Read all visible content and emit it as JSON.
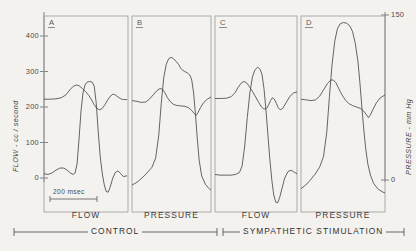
{
  "figure": {
    "axes": {
      "left": {
        "label": "FLOW - cc / second",
        "ticks": [
          {
            "value": 400,
            "text": "400"
          },
          {
            "value": 300,
            "text": "300"
          },
          {
            "value": 200,
            "text": "200"
          },
          {
            "value": 100,
            "text": "100"
          },
          {
            "value": 0,
            "text": "0"
          }
        ]
      },
      "right": {
        "label": "PRESSURE - mm Hg",
        "ticks": [
          {
            "value": 150,
            "text": "150"
          },
          {
            "value": 0,
            "text": "0"
          }
        ]
      }
    },
    "scalebar": {
      "text": "200 msec"
    },
    "panels": [
      {
        "letter": "A",
        "caption": "FLOW"
      },
      {
        "letter": "B",
        "caption": "PRESSURE"
      },
      {
        "letter": "C",
        "caption": "FLOW"
      },
      {
        "letter": "D",
        "caption": "PRESSURE"
      }
    ],
    "groups": [
      {
        "label": "CONTROL"
      },
      {
        "label": "SYMPATHETIC  STIMULATION"
      }
    ]
  },
  "chart_data": {
    "type": "line",
    "title": "",
    "xlabel": "",
    "ylabel": "FLOW - cc / second",
    "ylabel_right": "PRESSURE - mm Hg",
    "ylim": [
      0,
      450
    ],
    "ylim_right": [
      0,
      190
    ],
    "yticks": [
      0,
      100,
      200,
      300,
      400
    ],
    "yticks_right": [
      0,
      150
    ],
    "grid": false,
    "legend": "none",
    "scalebar_ms": 200,
    "panels": [
      {
        "letter": "A",
        "caption": "FLOW",
        "condition": "CONTROL",
        "series": [
          {
            "name": "baseline-trace",
            "points": [
              [
                0,
                222
              ],
              [
                10,
                222
              ],
              [
                18,
                223
              ],
              [
                26,
                226
              ],
              [
                33,
                234
              ],
              [
                39,
                248
              ],
              [
                44,
                258
              ],
              [
                49,
                262
              ],
              [
                53,
                260
              ],
              [
                58,
                252
              ],
              [
                63,
                243
              ],
              [
                68,
                232
              ],
              [
                72,
                220
              ],
              [
                76,
                206
              ],
              [
                80,
                196
              ],
              [
                84,
                192
              ],
              [
                88,
                196
              ],
              [
                92,
                206
              ],
              [
                96,
                219
              ],
              [
                100,
                230
              ],
              [
                104,
                236
              ],
              [
                108,
                234
              ],
              [
                112,
                228
              ],
              [
                116,
                223
              ],
              [
                120,
                221
              ],
              [
                125,
                221
              ]
            ]
          },
          {
            "name": "flow-trace",
            "points": [
              [
                0,
                12
              ],
              [
                6,
                10
              ],
              [
                12,
                14
              ],
              [
                18,
                22
              ],
              [
                24,
                28
              ],
              [
                30,
                28
              ],
              [
                35,
                22
              ],
              [
                40,
                14
              ],
              [
                44,
                10
              ],
              [
                47,
                14
              ],
              [
                50,
                40
              ],
              [
                53,
                110
              ],
              [
                56,
                190
              ],
              [
                59,
                240
              ],
              [
                62,
                262
              ],
              [
                65,
                270
              ],
              [
                69,
                272
              ],
              [
                73,
                270
              ],
              [
                76,
                258
              ],
              [
                79,
                210
              ],
              [
                82,
                130
              ],
              [
                85,
                60
              ],
              [
                88,
                14
              ],
              [
                91,
                -18
              ],
              [
                94,
                -38
              ],
              [
                97,
                -40
              ],
              [
                100,
                -26
              ],
              [
                104,
                0
              ],
              [
                108,
                16
              ],
              [
                112,
                20
              ],
              [
                116,
                12
              ],
              [
                120,
                4
              ],
              [
                125,
                6
              ]
            ]
          }
        ]
      },
      {
        "letter": "B",
        "caption": "PRESSURE",
        "condition": "CONTROL",
        "series": [
          {
            "name": "baseline-trace",
            "points": [
              [
                0,
                218
              ],
              [
                8,
                216
              ],
              [
                15,
                213
              ],
              [
                22,
                214
              ],
              [
                28,
                222
              ],
              [
                34,
                234
              ],
              [
                40,
                246
              ],
              [
                45,
                252
              ],
              [
                49,
                250
              ],
              [
                53,
                240
              ],
              [
                57,
                226
              ],
              [
                62,
                214
              ],
              [
                67,
                207
              ],
              [
                73,
                204
              ],
              [
                79,
                203
              ],
              [
                85,
                202
              ],
              [
                91,
                198
              ],
              [
                96,
                190
              ],
              [
                100,
                182
              ],
              [
                103,
                176
              ],
              [
                106,
                184
              ],
              [
                110,
                198
              ],
              [
                115,
                212
              ],
              [
                121,
                222
              ],
              [
                127,
                228
              ]
            ]
          },
          {
            "name": "pressure-trace",
            "points": [
              [
                0,
                -20
              ],
              [
                8,
                -12
              ],
              [
                16,
                0
              ],
              [
                24,
                14
              ],
              [
                32,
                30
              ],
              [
                38,
                56
              ],
              [
                43,
                120
              ],
              [
                47,
                210
              ],
              [
                51,
                282
              ],
              [
                55,
                320
              ],
              [
                59,
                336
              ],
              [
                63,
                340
              ],
              [
                67,
                336
              ],
              [
                71,
                328
              ],
              [
                75,
                320
              ],
              [
                78,
                310
              ],
              [
                81,
                304
              ],
              [
                85,
                300
              ],
              [
                89,
                296
              ],
              [
                93,
                290
              ],
              [
                96,
                276
              ],
              [
                99,
                240
              ],
              [
                102,
                180
              ],
              [
                105,
                110
              ],
              [
                108,
                50
              ],
              [
                112,
                6
              ],
              [
                118,
                -18
              ],
              [
                124,
                -30
              ],
              [
                127,
                -34
              ]
            ]
          }
        ]
      },
      {
        "letter": "C",
        "caption": "FLOW",
        "condition": "SYMPATHETIC STIMULATION",
        "series": [
          {
            "name": "baseline-trace",
            "points": [
              [
                0,
                224
              ],
              [
                10,
                224
              ],
              [
                18,
                225
              ],
              [
                25,
                229
              ],
              [
                31,
                240
              ],
              [
                36,
                256
              ],
              [
                41,
                268
              ],
              [
                45,
                272
              ],
              [
                49,
                268
              ],
              [
                53,
                258
              ],
              [
                58,
                244
              ],
              [
                63,
                228
              ],
              [
                68,
                212
              ],
              [
                72,
                200
              ],
              [
                76,
                194
              ],
              [
                80,
                196
              ],
              [
                83,
                206
              ],
              [
                86,
                218
              ],
              [
                89,
                226
              ],
              [
                92,
                222
              ],
              [
                95,
                210
              ],
              [
                98,
                198
              ],
              [
                101,
                192
              ],
              [
                105,
                196
              ],
              [
                110,
                212
              ],
              [
                116,
                230
              ],
              [
                122,
                240
              ],
              [
                127,
                242
              ]
            ]
          },
          {
            "name": "flow-trace",
            "points": [
              [
                0,
                10
              ],
              [
                8,
                8
              ],
              [
                16,
                8
              ],
              [
                24,
                8
              ],
              [
                32,
                10
              ],
              [
                38,
                16
              ],
              [
                42,
                34
              ],
              [
                46,
                90
              ],
              [
                50,
                170
              ],
              [
                54,
                240
              ],
              [
                58,
                285
              ],
              [
                62,
                305
              ],
              [
                66,
                312
              ],
              [
                70,
                306
              ],
              [
                73,
                290
              ],
              [
                76,
                250
              ],
              [
                79,
                190
              ],
              [
                82,
                120
              ],
              [
                85,
                52
              ],
              [
                88,
                -6
              ],
              [
                91,
                -48
              ],
              [
                94,
                -68
              ],
              [
                97,
                -70
              ],
              [
                100,
                -56
              ],
              [
                104,
                -28
              ],
              [
                108,
                0
              ],
              [
                113,
                18
              ],
              [
                118,
                22
              ],
              [
                123,
                16
              ],
              [
                127,
                12
              ]
            ]
          }
        ]
      },
      {
        "letter": "D",
        "caption": "PRESSURE",
        "condition": "SYMPATHETIC STIMULATION",
        "series": [
          {
            "name": "baseline-trace",
            "points": [
              [
                0,
                222
              ],
              [
                8,
                220
              ],
              [
                15,
                218
              ],
              [
                22,
                220
              ],
              [
                28,
                230
              ],
              [
                34,
                248
              ],
              [
                40,
                266
              ],
              [
                45,
                276
              ],
              [
                49,
                276
              ],
              [
                53,
                268
              ],
              [
                57,
                252
              ],
              [
                62,
                234
              ],
              [
                67,
                220
              ],
              [
                72,
                210
              ],
              [
                78,
                204
              ],
              [
                84,
                200
              ],
              [
                90,
                196
              ],
              [
                95,
                188
              ],
              [
                99,
                178
              ],
              [
                102,
                170
              ],
              [
                105,
                178
              ],
              [
                109,
                194
              ],
              [
                114,
                212
              ],
              [
                120,
                226
              ],
              [
                127,
                234
              ]
            ]
          },
          {
            "name": "pressure-trace",
            "points": [
              [
                0,
                -30
              ],
              [
                7,
                -20
              ],
              [
                14,
                -6
              ],
              [
                21,
                10
              ],
              [
                28,
                30
              ],
              [
                34,
                60
              ],
              [
                39,
                130
              ],
              [
                43,
                230
              ],
              [
                47,
                320
              ],
              [
                51,
                385
              ],
              [
                55,
                420
              ],
              [
                59,
                434
              ],
              [
                64,
                438
              ],
              [
                69,
                436
              ],
              [
                74,
                428
              ],
              [
                78,
                412
              ],
              [
                82,
                380
              ],
              [
                86,
                330
              ],
              [
                89,
                270
              ],
              [
                92,
                200
              ],
              [
                95,
                135
              ],
              [
                98,
                80
              ],
              [
                101,
                40
              ],
              [
                105,
                8
              ],
              [
                110,
                -16
              ],
              [
                117,
                -32
              ],
              [
                124,
                -40
              ],
              [
                127,
                -42
              ]
            ]
          }
        ]
      }
    ]
  }
}
